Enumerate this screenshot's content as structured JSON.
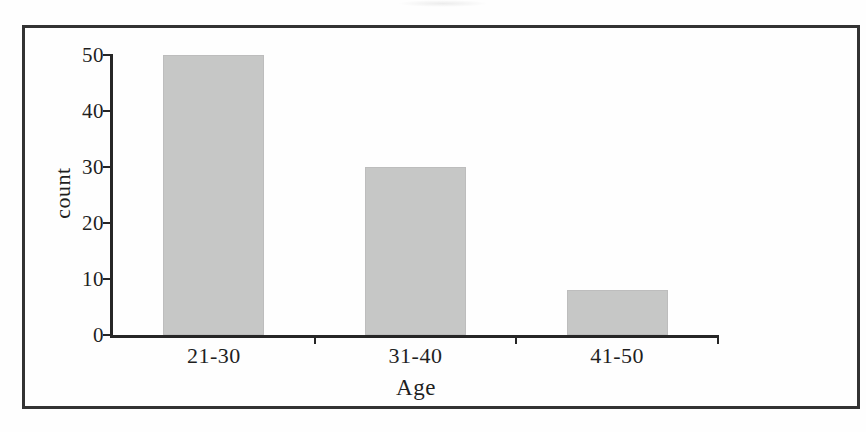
{
  "chart_data": {
    "type": "bar",
    "categories": [
      "21-30",
      "31-40",
      "41-50"
    ],
    "values": [
      50,
      30,
      8
    ],
    "xlabel": "Age",
    "ylabel": "count",
    "ylim": [
      0,
      50
    ],
    "yticks": [
      0,
      10,
      20,
      30,
      40,
      50
    ],
    "grid": false,
    "legend_position": "none",
    "bar_color": "#c6c7c6",
    "bar_edge_color": "#bdbdbd",
    "axis_color": "#262626",
    "frame_color": "#333333",
    "text_color": "#1f1f1f",
    "background_color": "#fefefe"
  }
}
